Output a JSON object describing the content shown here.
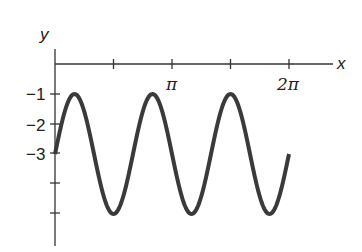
{
  "chart_data": {
    "type": "line",
    "title": "",
    "xlabel": "x",
    "ylabel": "y",
    "function": "y = -3 + 2 sin(3x)",
    "x_ticks": [
      {
        "value": 0,
        "label": ""
      },
      {
        "value": 1.5708,
        "label": ""
      },
      {
        "value": 3.1416,
        "label": "π"
      },
      {
        "value": 4.7124,
        "label": ""
      },
      {
        "value": 6.2832,
        "label": "2π"
      }
    ],
    "y_ticks": [
      {
        "value": -1,
        "label": "−1"
      },
      {
        "value": -2,
        "label": "−2"
      },
      {
        "value": -3,
        "label": "−3"
      },
      {
        "value": -4,
        "label": ""
      },
      {
        "value": -5,
        "label": ""
      }
    ],
    "xlim": [
      0,
      6.2832
    ],
    "ylim": [
      -6,
      0
    ],
    "series": [
      {
        "name": "y = -3 + 2 sin(3x)",
        "x": [
          0,
          0.5236,
          1.0472,
          1.5708,
          2.0944,
          2.618,
          3.1416,
          3.6652,
          4.1888,
          4.7124,
          5.236,
          5.7596,
          6.2832
        ],
        "y": [
          -3,
          -1,
          -3,
          -5,
          -3,
          -1,
          -3,
          -5,
          -3,
          -1,
          -3,
          -5,
          -3
        ]
      }
    ],
    "grid": false,
    "legend": "none",
    "color": "#3a3a3a"
  },
  "axes": {
    "x_label": "x",
    "y_label": "y",
    "x_tick_labels": [
      "π",
      "2π"
    ],
    "y_tick_labels": [
      "−1",
      "−2",
      "−3"
    ]
  }
}
